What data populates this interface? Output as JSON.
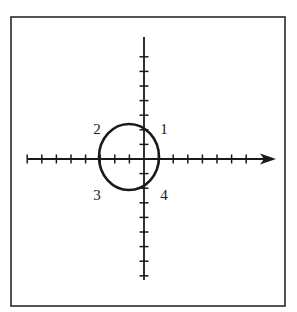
{
  "diagram": {
    "type": "coordinate-axes-with-closed-curve",
    "frame": {
      "x": 11,
      "y": 17,
      "width": 274,
      "height": 289,
      "stroke": "#2a2a2a"
    },
    "origin": {
      "x": 144,
      "y": 159
    },
    "tick_spacing": 14.6,
    "x_axis": {
      "start_x": 28,
      "end_x": 276,
      "arrow": true,
      "ticks_left": 8,
      "ticks_right": 7
    },
    "y_axis": {
      "start_y": 37,
      "end_y": 280,
      "arrow": false,
      "ticks_up": 7,
      "ticks_down": 8
    },
    "curve": {
      "shape": "ellipse",
      "cx": 129,
      "cy": 157,
      "rx": 30,
      "ry": 33,
      "stroke": "#1a1a1a",
      "stroke_width": 2.6
    },
    "labels": [
      {
        "text": "1",
        "x": 164,
        "y": 129
      },
      {
        "text": "2",
        "x": 97,
        "y": 129
      },
      {
        "text": "3",
        "x": 97,
        "y": 195
      },
      {
        "text": "4",
        "x": 164,
        "y": 195
      }
    ],
    "colors": {
      "ink": "#1a1a1a",
      "background": "#ffffff"
    }
  }
}
